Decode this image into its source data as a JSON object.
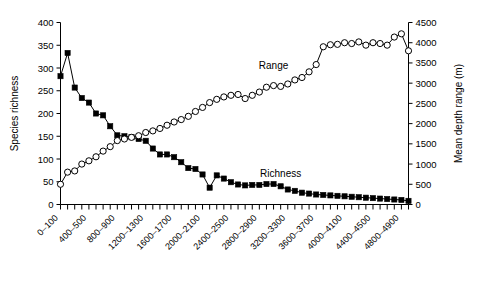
{
  "chart_data": {
    "type": "line",
    "title": "",
    "xlabel": "",
    "ylabel": "Species richness",
    "y2label": "Mean depth range (m)",
    "ylim": [
      0,
      400
    ],
    "y2lim": [
      0,
      4500
    ],
    "yticks": [
      0,
      50,
      100,
      150,
      200,
      250,
      300,
      350,
      400
    ],
    "y2ticks": [
      0,
      500,
      1000,
      1500,
      2000,
      2500,
      3000,
      3500,
      4000,
      4500
    ],
    "grid": false,
    "legend_position": "inline-annotations",
    "xtick_label_rotation": -45,
    "xtick_label_every": 4,
    "categories": [
      "0-100",
      "100-200",
      "200-300",
      "300-400",
      "400-500",
      "500-600",
      "600-700",
      "700-800",
      "800-900",
      "900-1000",
      "1000-1100",
      "1100-1200",
      "1200-1300",
      "1300-1400",
      "1400-1500",
      "1500-1600",
      "1600-1700",
      "1700-1800",
      "1800-1900",
      "1900-2000",
      "2000-2100",
      "2100-2200",
      "2200-2300",
      "2300-2400",
      "2400-2500",
      "2500-2600",
      "2600-2700",
      "2700-2800",
      "2800-2900",
      "2900-3000",
      "3000-3100",
      "3100-3200",
      "3200-3300",
      "3300-3400",
      "3400-3500",
      "3500-3600",
      "3600-3700",
      "3700-3800",
      "3800-3900",
      "3900-4000",
      "4000-4100",
      "4100-4200",
      "4200-4300",
      "4300-4400",
      "4400-4500",
      "4500-4600",
      "4600-4700",
      "4700-4800",
      "4800-4900",
      "4900-5000"
    ],
    "xtick_labels_shown": [
      "0-100",
      "400-500",
      "800-900",
      "1200-1300",
      "1600-1700",
      "2000-2100",
      "2400-2500",
      "2800-2900",
      "3200-3300",
      "3600-3700",
      "4000-4100",
      "4400-4500",
      "4800-4900"
    ],
    "series": [
      {
        "name": "Richness",
        "axis": "left",
        "marker": "filled-square",
        "annotation": "Richness",
        "values": [
          282,
          333,
          257,
          234,
          224,
          200,
          196,
          172,
          152,
          150,
          148,
          144,
          140,
          123,
          110,
          110,
          104,
          93,
          80,
          78,
          66,
          37,
          64,
          57,
          49,
          44,
          42,
          43,
          43,
          45,
          45,
          40,
          33,
          30,
          26,
          24,
          22,
          21,
          20,
          19,
          18,
          17,
          16,
          15,
          14,
          13,
          12,
          11,
          10,
          8
        ]
      },
      {
        "name": "Range",
        "axis": "right",
        "marker": "open-circle",
        "annotation": "Range",
        "values": [
          500,
          800,
          830,
          1000,
          1080,
          1180,
          1320,
          1430,
          1580,
          1620,
          1660,
          1700,
          1780,
          1820,
          1880,
          1960,
          2040,
          2100,
          2180,
          2300,
          2400,
          2520,
          2600,
          2660,
          2700,
          2720,
          2620,
          2700,
          2780,
          2900,
          2940,
          2920,
          2980,
          3080,
          3140,
          3280,
          3460,
          3900,
          3950,
          3960,
          4000,
          3980,
          4020,
          3940,
          4000,
          3980,
          3940,
          4140,
          4220,
          3800
        ]
      }
    ],
    "annotations": [
      {
        "text": "Range",
        "x_index": 30,
        "y_value": 3350
      },
      {
        "text": "Richness",
        "x_index": 31,
        "y_value": 60
      }
    ]
  }
}
